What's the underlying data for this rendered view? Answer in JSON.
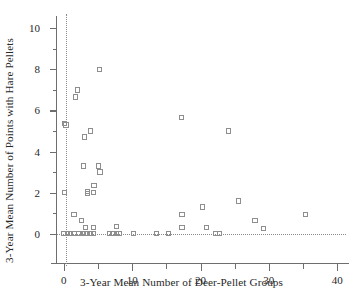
{
  "chart_data": {
    "type": "scatter",
    "title": "",
    "xlabel": "3-Year Mean Number of Deer-Pellet Groups",
    "ylabel": "3-Year Mean Number of Points with Hare Pellets",
    "xlim": [
      -1.0,
      41.0
    ],
    "ylim": [
      -0.45,
      10.4
    ],
    "xticks": [
      0,
      10,
      20,
      30,
      40
    ],
    "xtick_labels": [
      "0",
      "10",
      "20",
      "30",
      "40"
    ],
    "xticks_minor": [
      5,
      15,
      25,
      35
    ],
    "yticks": [
      0,
      2,
      4,
      6,
      8,
      10
    ],
    "ytick_labels": [
      "0",
      "2",
      "4",
      "6",
      "8",
      "10"
    ],
    "yticks_minor": [
      1,
      3,
      5,
      7,
      9
    ],
    "grid": false,
    "legend": null,
    "marker": "open-square",
    "marker_color": "#8e8e8e",
    "reference_lines": [
      {
        "orientation": "vertical",
        "value": 0.35,
        "style": "dotted"
      },
      {
        "orientation": "horizontal",
        "value": 0.0,
        "style": "dotted"
      }
    ],
    "points": [
      [
        0.1,
        5.35
      ],
      [
        0.3,
        5.3
      ],
      [
        0.1,
        2.0
      ],
      [
        1.7,
        6.65
      ],
      [
        2.0,
        7.0
      ],
      [
        5.2,
        8.0
      ],
      [
        3.0,
        4.7
      ],
      [
        3.9,
        5.0
      ],
      [
        2.9,
        3.3
      ],
      [
        5.1,
        3.3
      ],
      [
        5.3,
        3.0
      ],
      [
        4.4,
        2.35
      ],
      [
        3.5,
        2.05
      ],
      [
        3.5,
        1.95
      ],
      [
        4.3,
        2.0
      ],
      [
        1.5,
        0.95
      ],
      [
        2.6,
        0.65
      ],
      [
        3.2,
        0.3
      ],
      [
        4.3,
        0.3
      ],
      [
        7.7,
        0.35
      ],
      [
        17.2,
        5.65
      ],
      [
        24.1,
        5.0
      ],
      [
        25.6,
        1.6
      ],
      [
        20.3,
        1.3
      ],
      [
        17.3,
        0.95
      ],
      [
        35.4,
        0.95
      ],
      [
        28.0,
        0.65
      ],
      [
        17.3,
        0.3
      ],
      [
        20.9,
        0.3
      ],
      [
        29.2,
        0.25
      ],
      [
        0.05,
        0.0
      ],
      [
        0.5,
        0.0
      ],
      [
        0.95,
        0.0
      ],
      [
        1.5,
        0.0
      ],
      [
        2.2,
        0.0
      ],
      [
        2.7,
        0.0
      ],
      [
        3.1,
        0.0
      ],
      [
        3.5,
        0.0
      ],
      [
        3.9,
        0.0
      ],
      [
        4.3,
        0.0
      ],
      [
        6.7,
        0.0
      ],
      [
        7.2,
        0.0
      ],
      [
        7.7,
        0.0
      ],
      [
        8.1,
        0.0
      ],
      [
        10.2,
        0.0
      ],
      [
        13.6,
        0.0
      ],
      [
        15.3,
        0.0
      ],
      [
        22.2,
        0.0
      ],
      [
        22.8,
        0.0
      ]
    ]
  }
}
